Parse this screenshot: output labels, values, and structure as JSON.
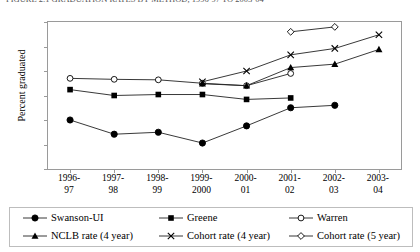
{
  "caption": "FIGURE 2.1   GRADUATION RATES BY METHOD, 1996-97 TO 2003-04",
  "chart_data": {
    "type": "line",
    "title": "",
    "xlabel": "",
    "ylabel": "Percent graduated",
    "ylim": [
      45,
      75
    ],
    "yticks": [
      45,
      50,
      55,
      60,
      65,
      70,
      75
    ],
    "grid": false,
    "legend_position": "bottom",
    "categories": [
      "1996-\n97",
      "1997-\n98",
      "1998-\n99",
      "1999-\n2000",
      "2000-\n01",
      "2001-\n02",
      "2002-\n03",
      "2003-\n04"
    ],
    "series": [
      {
        "name": "Swanson-UI",
        "marker": "filled-circle",
        "values": [
          55.0,
          52.1,
          52.5,
          50.3,
          53.8,
          57.5,
          58.0,
          null
        ]
      },
      {
        "name": "Greene",
        "marker": "filled-square",
        "values": [
          61.2,
          60.0,
          60.2,
          60.2,
          59.2,
          59.5,
          null,
          null
        ]
      },
      {
        "name": "Warren",
        "marker": "open-circle",
        "values": [
          63.5,
          63.3,
          63.2,
          62.5,
          62.0,
          64.5,
          null,
          null
        ]
      },
      {
        "name": "NCLB rate (4 year)",
        "marker": "filled-triangle",
        "values": [
          null,
          null,
          null,
          62.4,
          62.0,
          65.7,
          66.4,
          69.4
        ]
      },
      {
        "name": "Cohort rate (4 year)",
        "marker": "cross",
        "values": [
          null,
          null,
          null,
          62.8,
          65.0,
          68.3,
          69.6,
          72.4
        ]
      },
      {
        "name": "Cohort rate (5 year)",
        "marker": "open-diamond",
        "values": [
          null,
          null,
          null,
          null,
          null,
          73.0,
          74.0,
          null
        ]
      }
    ]
  }
}
